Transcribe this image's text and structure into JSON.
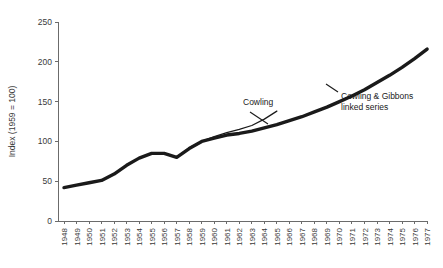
{
  "chart_data": {
    "type": "line",
    "title": "",
    "xlabel": "",
    "ylabel": "Index (1959 = 100)",
    "ylim": [
      0,
      250
    ],
    "yticks": [
      0,
      50,
      100,
      150,
      200,
      250
    ],
    "grid": false,
    "legend_position": "inline-annotations",
    "categories": [
      "1948",
      "1949",
      "1950",
      "1951",
      "1952",
      "1953",
      "1954",
      "1955",
      "1956",
      "1957",
      "1958",
      "1959",
      "1960",
      "1961",
      "1962",
      "1963",
      "1964",
      "1965",
      "1966",
      "1967",
      "1968",
      "1969",
      "1970",
      "1971",
      "1972",
      "1973",
      "1974",
      "1975",
      "1976",
      "1977"
    ],
    "series": [
      {
        "name": "Cowling & Gibbons linked series",
        "style": "thick",
        "x": [
          "1948",
          "1949",
          "1950",
          "1951",
          "1952",
          "1953",
          "1954",
          "1955",
          "1956",
          "1957",
          "1958",
          "1959",
          "1960",
          "1961",
          "1962",
          "1963",
          "1964",
          "1965",
          "1966",
          "1967",
          "1968",
          "1969",
          "1970",
          "1971",
          "1972",
          "1973",
          "1974",
          "1975",
          "1976",
          "1977"
        ],
        "values": [
          42,
          45,
          48,
          51,
          59,
          70,
          79,
          85,
          85,
          80,
          91,
          100,
          104,
          108,
          110,
          113,
          117,
          121,
          126,
          131,
          137,
          143,
          150,
          157,
          165,
          174,
          183,
          193,
          204,
          216
        ]
      },
      {
        "name": "Cowling",
        "style": "thin",
        "x": [
          "1957",
          "1958",
          "1959",
          "1960",
          "1961",
          "1962",
          "1963",
          "1964",
          "1965"
        ],
        "values": [
          80,
          92,
          100,
          106,
          111,
          115,
          120,
          128,
          138
        ]
      }
    ],
    "annotations": [
      {
        "id": "cowling",
        "text": "Cowling",
        "lines": [
          "Cowling"
        ]
      },
      {
        "id": "cowling-gibbons",
        "text": "Cowling & Gibbons linked series",
        "lines": [
          "Cowling & Gibbons",
          "linked series"
        ]
      }
    ]
  }
}
